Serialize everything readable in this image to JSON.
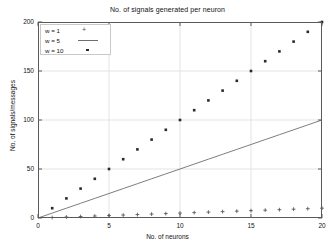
{
  "chart_data": {
    "type": "scatter",
    "title": "No. of signals generated per neuron",
    "xlabel": "No. of neurons",
    "ylabel": "No. of signals/messages",
    "xlim": [
      0,
      20
    ],
    "ylim": [
      0,
      200
    ],
    "xticks": [
      0,
      5,
      10,
      15,
      20
    ],
    "yticks": [
      0,
      50,
      100,
      150,
      200
    ],
    "grid": true,
    "legend_position": "top-left",
    "x": [
      1,
      2,
      3,
      4,
      5,
      6,
      7,
      8,
      9,
      10,
      11,
      12,
      13,
      14,
      15,
      16,
      17,
      18,
      19,
      20
    ],
    "series": [
      {
        "name": "w = 1",
        "marker": "plus",
        "color": "#4a4a4a",
        "values": [
          0.5,
          1,
          1.5,
          2,
          2.5,
          3,
          3.5,
          4,
          4.5,
          5,
          5.5,
          6,
          6.5,
          7,
          7.5,
          8,
          8.5,
          9,
          9.5,
          10
        ]
      },
      {
        "name": "w = 5",
        "marker": "line",
        "color": "#6e6e6e",
        "values": [
          5,
          10,
          15,
          20,
          25,
          30,
          35,
          40,
          45,
          50,
          55,
          60,
          65,
          70,
          75,
          80,
          85,
          90,
          95,
          100
        ]
      },
      {
        "name": "w = 10",
        "marker": "dot",
        "color": "#2a2a2a",
        "values": [
          10,
          20,
          30,
          40,
          50,
          60,
          70,
          80,
          90,
          100,
          110,
          120,
          130,
          140,
          150,
          160,
          170,
          180,
          190,
          200
        ]
      }
    ]
  },
  "legend": {
    "items": [
      {
        "label": "w = 1",
        "key": "plus-marker"
      },
      {
        "label": "w = 5",
        "key": "line-marker"
      },
      {
        "label": "w = 10",
        "key": "dot-marker"
      }
    ]
  },
  "axis": {
    "y_tick_labels": [
      "200",
      "150",
      "100",
      "50",
      "0"
    ],
    "x_tick_labels": [
      "0",
      "5",
      "10",
      "15",
      "20"
    ]
  },
  "colors": {
    "frame": "#5a5a5a",
    "grid": "#e3e3e3",
    "text": "#111111",
    "background": "#ffffff"
  }
}
